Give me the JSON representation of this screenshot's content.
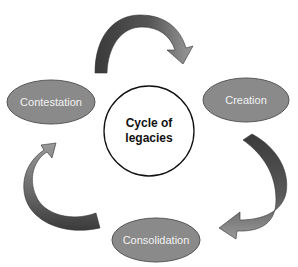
{
  "diagram": {
    "title": "Cycle of legacies",
    "center": {
      "line1": "Cycle of",
      "line2": "legacies"
    },
    "nodes": [
      {
        "id": "contestation",
        "label": "Contestation"
      },
      {
        "id": "creation",
        "label": "Creation"
      },
      {
        "id": "consolidation",
        "label": "Consolidation"
      }
    ],
    "edges": [
      {
        "from": "contestation",
        "to": "creation"
      },
      {
        "from": "creation",
        "to": "consolidation"
      },
      {
        "from": "consolidation",
        "to": "contestation"
      }
    ],
    "colors": {
      "node_fill": "#8a8a8a",
      "node_stroke": "#555555",
      "arrow_dark": "#3d3d3d",
      "arrow_light": "#8e8e8e",
      "center_stroke": "#111111"
    }
  }
}
